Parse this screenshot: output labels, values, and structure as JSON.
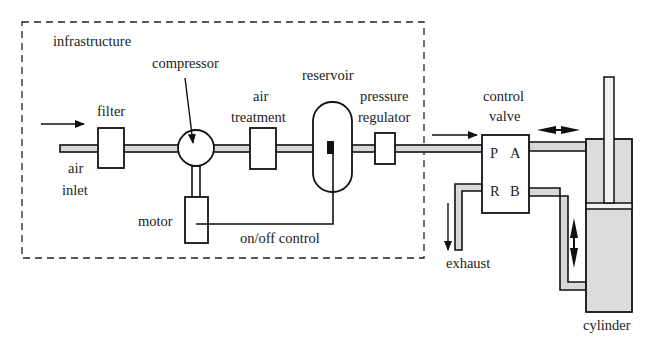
{
  "colors": {
    "stroke": "#111111",
    "pipe_fill": "#d8d8d8",
    "cylinder_fill": "#dcdcdc",
    "background": "#ffffff"
  },
  "labels": {
    "infrastructure": "infrastructure",
    "compressor": "compressor",
    "reservoir": "reservoir",
    "filter": "filter",
    "air_treatment_1": "air",
    "air_treatment_2": "treatment",
    "pressure_regulator_1": "pressure",
    "pressure_regulator_2": "regulator",
    "air_inlet_1": "air",
    "air_inlet_2": "inlet",
    "motor": "motor",
    "on_off_control": "on/off control",
    "control_valve_1": "control",
    "control_valve_2": "valve",
    "port_p": "P",
    "port_a": "A",
    "port_r": "R",
    "port_b": "B",
    "exhaust": "exhaust",
    "cylinder": "cylinder"
  },
  "groups": {
    "infrastructure_boundary": "infrastructure"
  }
}
